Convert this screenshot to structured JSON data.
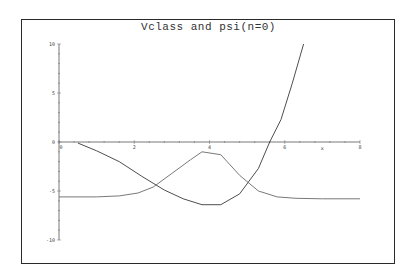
{
  "chart_data": {
    "type": "line",
    "title": "Vclass and psi(n=0)",
    "xlabel": "x",
    "ylabel": "",
    "xlim": [
      0,
      8
    ],
    "ylim": [
      -10,
      10
    ],
    "x_ticks": [
      0,
      2,
      4,
      6,
      8
    ],
    "y_ticks": [
      10,
      5,
      0,
      -5,
      -10
    ],
    "grid": false,
    "legend": null,
    "series": [
      {
        "name": "Vclass",
        "color": "#3a3a3a",
        "x": [
          0.5,
          1.0,
          1.6,
          2.2,
          2.8,
          3.3,
          3.8,
          4.3,
          4.8,
          5.3,
          5.6,
          5.9,
          6.2,
          6.5
        ],
        "y": [
          -0.1,
          -0.9,
          -2.0,
          -3.5,
          -4.9,
          -5.8,
          -6.4,
          -6.4,
          -5.3,
          -2.7,
          0.0,
          2.3,
          6.0,
          10.0
        ]
      },
      {
        "name": "psi(n=0)",
        "color": "#6a6a6a",
        "x": [
          0.0,
          0.5,
          1.0,
          1.6,
          2.1,
          2.5,
          3.0,
          3.5,
          3.8,
          4.3,
          4.8,
          5.3,
          5.8,
          6.3,
          7.0,
          8.0
        ],
        "y": [
          -5.6,
          -5.6,
          -5.6,
          -5.5,
          -5.2,
          -4.6,
          -3.2,
          -1.8,
          -1.0,
          -1.3,
          -3.4,
          -5.0,
          -5.6,
          -5.75,
          -5.8,
          -5.8
        ]
      }
    ]
  }
}
